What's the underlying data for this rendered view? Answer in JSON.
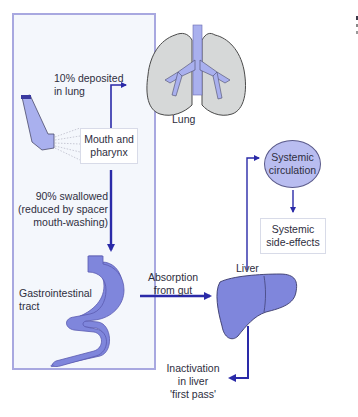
{
  "diagram": {
    "title": "",
    "nodes": {
      "lung": {
        "label": "Lung"
      },
      "mouth": {
        "label_line1": "Mouth and",
        "label_line2": "pharynx"
      },
      "systemic_circulation": {
        "label_line1": "Systemic",
        "label_line2": "circulation"
      },
      "systemic_side_effects": {
        "label_line1": "Systemic",
        "label_line2": "side-effects"
      },
      "gi_tract": {
        "label_line1": "Gastrointestinal",
        "label_line2": "tract"
      },
      "liver": {
        "label": "Liver"
      }
    },
    "edges": {
      "deposited": {
        "label_line1": "10% deposited",
        "label_line2": "in lung"
      },
      "swallowed": {
        "label_line1": "90% swallowed",
        "label_line2": "(reduced by spacer",
        "label_line3": "mouth-washing)"
      },
      "absorption": {
        "label_line1": "Absorption",
        "label_line2": "from gut"
      },
      "inactivation": {
        "label_line1": "Inactivation",
        "label_line2": "in liver",
        "label_line3": "'first pass'"
      }
    },
    "colors": {
      "frame_border": "#a8a8e0",
      "background": "#f4f7fc",
      "arrow": "#2a2aa8",
      "organ_fill": "#7f86dc",
      "lung_fill": "#d6d8d8",
      "bronchi_fill": "#a9b0ee",
      "circle_fill": "#b9bdf0"
    }
  }
}
